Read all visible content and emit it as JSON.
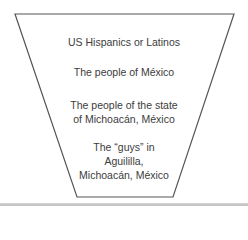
{
  "diagram": {
    "type": "inverted-funnel",
    "colors": {
      "outline": "#555555",
      "text": "#3c3c3c",
      "bottom_bar": "#c4c4c4"
    },
    "levels": [
      {
        "lines": [
          "US Hispanics or Latinos"
        ]
      },
      {
        "lines": [
          "The people of México"
        ]
      },
      {
        "lines": [
          "The people of the state",
          "of Michoacán, México"
        ]
      },
      {
        "lines": [
          "The “guys” in",
          "Aguililla,",
          "Michoacán, México"
        ]
      }
    ]
  }
}
